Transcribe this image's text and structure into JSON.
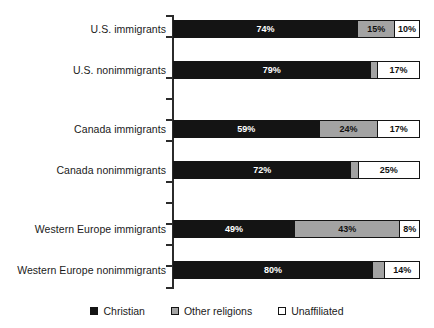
{
  "chart_data": {
    "type": "bar",
    "orientation": "horizontal",
    "stacked": true,
    "stack_total": 100,
    "title": "",
    "subtitle": "",
    "xlabel": "",
    "ylabel": "",
    "xlim": [
      0,
      100
    ],
    "grid": false,
    "legend_position": "bottom-center",
    "categories": [
      "U.S. immigrants",
      "U.S. nonimmigrants",
      "Canada immigrants",
      "Canada nonimmigrants",
      "Western Europe immigrants",
      "Western Europe nonimmigrants"
    ],
    "series": [
      {
        "name": "Christian",
        "color": "#141414",
        "values": [
          74,
          79,
          59,
          72,
          49,
          80
        ]
      },
      {
        "name": "Other religions",
        "color": "#a3a3a3",
        "values": [
          15,
          3,
          24,
          3,
          43,
          5
        ]
      },
      {
        "name": "Unaffiliated",
        "color": "#ffffff",
        "values": [
          10,
          17,
          17,
          25,
          8,
          14
        ]
      }
    ],
    "group_breaks_after": [
      1,
      3
    ],
    "rows": [
      {
        "label": "U.S. immigrants",
        "segments": [
          {
            "series": "Christian",
            "value": 74,
            "label": "74%",
            "show_label": true
          },
          {
            "series": "Other religions",
            "value": 15,
            "label": "15%",
            "show_label": true
          },
          {
            "series": "Unaffiliated",
            "value": 10,
            "label": "10%",
            "show_label": true
          }
        ]
      },
      {
        "label": "U.S. nonimmigrants",
        "segments": [
          {
            "series": "Christian",
            "value": 79,
            "label": "79%",
            "show_label": true
          },
          {
            "series": "Other religions",
            "value": 3,
            "label": "",
            "show_label": false
          },
          {
            "series": "Unaffiliated",
            "value": 17,
            "label": "17%",
            "show_label": true
          }
        ]
      },
      {
        "label": "Canada immigrants",
        "segments": [
          {
            "series": "Christian",
            "value": 59,
            "label": "59%",
            "show_label": true
          },
          {
            "series": "Other religions",
            "value": 24,
            "label": "24%",
            "show_label": true
          },
          {
            "series": "Unaffiliated",
            "value": 17,
            "label": "17%",
            "show_label": true
          }
        ]
      },
      {
        "label": "Canada nonimmigrants",
        "segments": [
          {
            "series": "Christian",
            "value": 72,
            "label": "72%",
            "show_label": true
          },
          {
            "series": "Other religions",
            "value": 3,
            "label": "",
            "show_label": false
          },
          {
            "series": "Unaffiliated",
            "value": 25,
            "label": "25%",
            "show_label": true
          }
        ]
      },
      {
        "label": "Western Europe immigrants",
        "segments": [
          {
            "series": "Christian",
            "value": 49,
            "label": "49%",
            "show_label": true
          },
          {
            "series": "Other religions",
            "value": 43,
            "label": "43%",
            "show_label": true
          },
          {
            "series": "Unaffiliated",
            "value": 8,
            "label": "8%",
            "show_label": true
          }
        ]
      },
      {
        "label": "Western Europe nonimmigrants",
        "segments": [
          {
            "series": "Christian",
            "value": 80,
            "label": "80%",
            "show_label": true
          },
          {
            "series": "Other religions",
            "value": 5,
            "label": "",
            "show_label": false
          },
          {
            "series": "Unaffiliated",
            "value": 14,
            "label": "14%",
            "show_label": true
          }
        ]
      }
    ],
    "legend": [
      {
        "label": "Christian",
        "color": "#141414",
        "swatch": "filled-black"
      },
      {
        "label": "Other religions",
        "color": "#a3a3a3",
        "swatch": "filled-gray"
      },
      {
        "label": "Unaffiliated",
        "color": "#ffffff",
        "swatch": "empty-white"
      }
    ]
  },
  "layout": {
    "row_tops": [
      18,
      59,
      118,
      159,
      218,
      259
    ],
    "tick_tops": [
      15,
      36,
      77,
      98,
      119,
      140,
      181,
      202,
      223,
      244,
      265,
      287
    ],
    "bar_left": 173,
    "bar_width": 247
  }
}
